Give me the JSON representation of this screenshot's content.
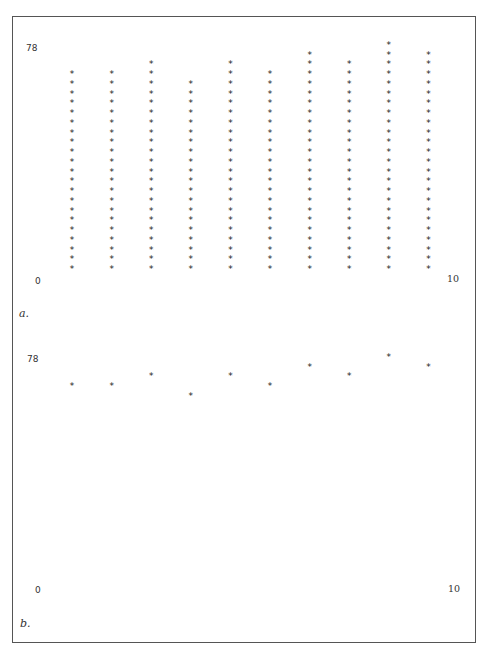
{
  "chart_data": [
    {
      "panel": "a.",
      "type": "scatter",
      "style": "stacked asterisk columns",
      "x": [
        1,
        2,
        3,
        4,
        5,
        6,
        7,
        8,
        9,
        10
      ],
      "values": [
        21,
        21,
        22,
        20,
        22,
        21,
        23,
        22,
        24,
        23
      ],
      "y_max_label": "78",
      "x_min_label": "0",
      "x_max_label": "10",
      "ylim": [
        0,
        78
      ],
      "xlim": [
        0,
        10
      ],
      "marker": "*"
    },
    {
      "panel": "b.",
      "type": "scatter",
      "style": "single asterisk per x",
      "x": [
        1,
        2,
        3,
        4,
        5,
        6,
        7,
        8,
        9,
        10
      ],
      "values": [
        21,
        21,
        22,
        20,
        22,
        21,
        23,
        22,
        24,
        23
      ],
      "y_max_label": "78",
      "x_min_label": "0",
      "x_max_label": "10",
      "ylim": [
        0,
        78
      ],
      "xlim": [
        0,
        10
      ],
      "marker": "*"
    }
  ],
  "panels": {
    "a": {
      "label": "a.",
      "ymax": "78",
      "xmin": "0",
      "xmax": "10"
    },
    "b": {
      "label": "b.",
      "ymax": "78",
      "xmin": "0",
      "xmax": "10"
    }
  },
  "marker": "*"
}
